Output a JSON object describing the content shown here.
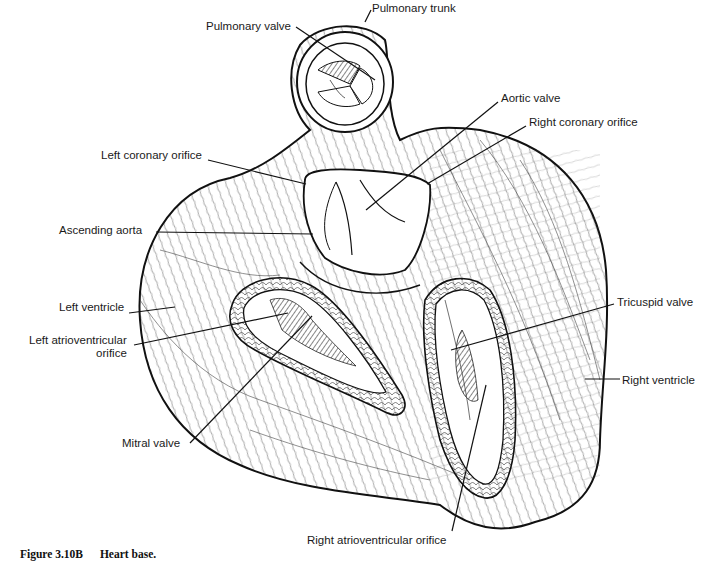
{
  "figure": {
    "caption_number": "Figure 3.10B",
    "caption_title": "Heart base.",
    "ink_color": "#111111",
    "background": "#ffffff"
  },
  "labels": [
    {
      "id": "pulmonary-trunk",
      "text": "Pulmonary trunk",
      "x": 372,
      "y": 2,
      "align": "left",
      "leader": [
        [
          371,
          10
        ],
        [
          365,
          22
        ]
      ]
    },
    {
      "id": "pulmonary-valve",
      "text": "Pulmonary valve",
      "x": 206,
      "y": 20,
      "align": "left",
      "leader": [
        [
          296,
          27
        ],
        [
          375,
          80
        ]
      ]
    },
    {
      "id": "aortic-valve",
      "text": "Aortic valve",
      "x": 501,
      "y": 92,
      "align": "left",
      "leader": [
        [
          498,
          102
        ],
        [
          366,
          210
        ]
      ]
    },
    {
      "id": "right-coronary-orifice",
      "text": "Right coronary orifice",
      "x": 529,
      "y": 116,
      "align": "left",
      "leader": [
        [
          526,
          126
        ],
        [
          427,
          184
        ]
      ]
    },
    {
      "id": "left-coronary-orifice",
      "text": "Left coronary orifice",
      "x": 101,
      "y": 149,
      "align": "left",
      "leader": [
        [
          208,
          160
        ],
        [
          306,
          184
        ]
      ]
    },
    {
      "id": "ascending-aorta",
      "text": "Ascending aorta",
      "x": 59,
      "y": 224,
      "align": "left",
      "leader": [
        [
          156,
          232
        ],
        [
          313,
          234
        ]
      ]
    },
    {
      "id": "left-ventricle",
      "text": "Left ventricle",
      "x": 59,
      "y": 301,
      "align": "left",
      "leader": [
        [
          129,
          313
        ],
        [
          175,
          307
        ]
      ]
    },
    {
      "id": "left-atrioventricular-orifice",
      "text": "Left atrioventricular\norifice",
      "x": 29,
      "y": 334,
      "align": "right",
      "leader": [
        [
          134,
          345
        ],
        [
          288,
          313
        ]
      ]
    },
    {
      "id": "mitral-valve",
      "text": "Mitral valve",
      "x": 122,
      "y": 437,
      "align": "left",
      "leader": [
        [
          190,
          443
        ],
        [
          312,
          316
        ]
      ]
    },
    {
      "id": "tricuspid-valve",
      "text": "Tricuspid valve",
      "x": 617,
      "y": 296,
      "align": "left",
      "leader": [
        [
          614,
          304
        ],
        [
          451,
          350
        ]
      ]
    },
    {
      "id": "right-ventricle",
      "text": "Right ventricle",
      "x": 622,
      "y": 374,
      "align": "left",
      "leader": [
        [
          620,
          379
        ],
        [
          585,
          379
        ]
      ]
    },
    {
      "id": "right-atrioventricular-orifice",
      "text": "Right atrioventricular orifice",
      "x": 307,
      "y": 534,
      "align": "left",
      "leader": [
        [
          452,
          531
        ],
        [
          486,
          385
        ]
      ]
    }
  ]
}
